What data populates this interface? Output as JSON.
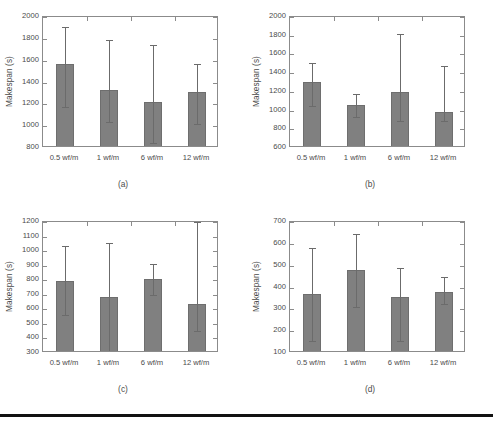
{
  "figure": {
    "background_color": "#ffffff",
    "bar_color": "#808080",
    "axis_color": "#8b8b8b",
    "error_bar_color": "#6b6b6b",
    "page_rule_color": "#121212"
  },
  "chart_data": [
    {
      "type": "bar",
      "panel": "a",
      "caption": "(a)",
      "title": "",
      "xlabel": "",
      "ylabel": "Makespan (s)",
      "categories": [
        "0.5 wf/m",
        "1 wf/m",
        "6 wf/m",
        "12 wf/m"
      ],
      "values": [
        1565,
        1335,
        1225,
        1315
      ],
      "error_upper": [
        1910,
        1790,
        1745,
        1570
      ],
      "error_lower": [
        1175,
        1040,
        850,
        1020
      ],
      "ylim": [
        800,
        2000
      ],
      "yticks": [
        800,
        1000,
        1200,
        1400,
        1600,
        1800,
        2000
      ],
      "grid": false,
      "legend": "none"
    },
    {
      "type": "bar",
      "panel": "b",
      "caption": "(b)",
      "title": "",
      "xlabel": "",
      "ylabel": "Makespan (s)",
      "categories": [
        "0.5 wf/m",
        "1 wf/m",
        "6 wf/m",
        "12 wf/m"
      ],
      "values": [
        1310,
        1055,
        1195,
        985
      ],
      "error_upper": [
        1510,
        1180,
        1815,
        1480
      ],
      "error_lower": [
        1050,
        930,
        885,
        890
      ],
      "ylim": [
        600,
        2000
      ],
      "yticks": [
        600,
        800,
        1000,
        1200,
        1400,
        1600,
        1800,
        2000
      ],
      "grid": false,
      "legend": "none"
    },
    {
      "type": "bar",
      "panel": "c",
      "caption": "(c)",
      "title": "",
      "xlabel": "",
      "ylabel": "Makespan (s)",
      "categories": [
        "0.5 wf/m",
        "1 wf/m",
        "6 wf/m",
        "12 wf/m"
      ],
      "values": [
        797,
        682,
        807,
        637
      ],
      "error_upper": [
        1032,
        1053,
        912,
        1200
      ],
      "error_lower": [
        562,
        310,
        700,
        450
      ],
      "ylim": [
        300,
        1200
      ],
      "yticks": [
        300,
        400,
        500,
        600,
        700,
        800,
        900,
        1000,
        1100,
        1200
      ],
      "grid": false,
      "legend": "none",
      "notes": "12 wf/m upper error bar is clipped at the axis maximum"
    },
    {
      "type": "bar",
      "panel": "d",
      "caption": "(d)",
      "title": "",
      "xlabel": "",
      "ylabel": "Makespan (s)",
      "categories": [
        "0.5 wf/m",
        "1 wf/m",
        "6 wf/m",
        "12 wf/m"
      ],
      "values": [
        370,
        480,
        358,
        378
      ],
      "error_upper": [
        582,
        645,
        490,
        450
      ],
      "error_lower": [
        155,
        310,
        155,
        325
      ],
      "ylim": [
        100,
        700
      ],
      "yticks": [
        100,
        200,
        300,
        400,
        500,
        600,
        700
      ],
      "grid": false,
      "legend": "none"
    }
  ]
}
